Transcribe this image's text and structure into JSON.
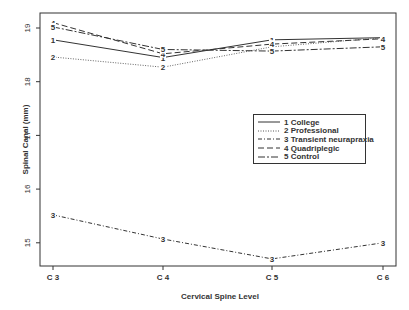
{
  "chart_data": {
    "type": "line",
    "title": "",
    "xlabel": "Cervical Spine Level",
    "ylabel": "Spinal Canal (mm)",
    "categories": [
      "C 3",
      "C 4",
      "C 5",
      "C 6"
    ],
    "yticks": [
      15,
      16,
      17,
      18,
      19
    ],
    "ylim": [
      14.6,
      19.3
    ],
    "grid": false,
    "legend_position": "right-center inside plot",
    "series": [
      {
        "id": "1",
        "name": "1 College",
        "marker": "1",
        "style": "solid",
        "values": [
          18.78,
          18.45,
          18.78,
          18.82
        ]
      },
      {
        "id": "2",
        "name": "2 Professional",
        "marker": "2",
        "style": "dotted",
        "values": [
          18.46,
          18.27,
          18.65,
          18.82
        ]
      },
      {
        "id": "3",
        "name": "3 Transient neurapraxia",
        "marker": "3",
        "style": "dashdot",
        "values": [
          15.52,
          15.07,
          14.7,
          15.0
        ]
      },
      {
        "id": "4",
        "name": "4 Quadriplegic",
        "marker": "4",
        "style": "longdash",
        "values": [
          19.1,
          18.52,
          18.7,
          18.8
        ]
      },
      {
        "id": "5",
        "name": "5 Control",
        "marker": "5",
        "style": "dashdot-long",
        "values": [
          19.02,
          18.6,
          18.57,
          18.65
        ]
      }
    ]
  },
  "axes": {
    "xlabel": "Cervical Spine Level",
    "ylabel": "Spinal Canal (mm)"
  },
  "legend": {
    "items": [
      "1 College",
      "2 Professional",
      "3 Transient neurapraxia",
      "4 Quadriplegic",
      "5 Control"
    ]
  }
}
